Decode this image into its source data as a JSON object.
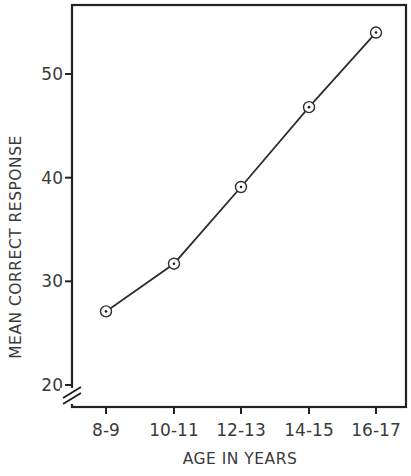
{
  "chart_data": {
    "type": "line",
    "title": "",
    "xlabel": "AGE IN YEARS",
    "ylabel": "MEAN CORRECT RESPONSE",
    "categories": [
      "8-9",
      "10-11",
      "12-13",
      "14-15",
      "16-17"
    ],
    "series": [
      {
        "name": "Mean correct response",
        "values": [
          27.1,
          31.7,
          39.1,
          46.8,
          54.0
        ],
        "marker": "circle-dot"
      }
    ],
    "yticks": [
      20,
      30,
      40,
      50
    ],
    "ytick_labels": [
      "20",
      "30",
      "40",
      "50"
    ],
    "ylim": [
      18.5,
      57
    ],
    "y_axis_break": true,
    "grid": false,
    "legend": null,
    "frame": "box"
  },
  "colors": {
    "line": "#2e2e2e",
    "frame": "#222222",
    "text": "#3a3a3a",
    "background": "#ffffff"
  }
}
